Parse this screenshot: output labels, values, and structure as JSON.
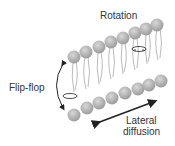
{
  "diagram": {
    "labels": {
      "rotation": "Rotation",
      "flipflop": "Flip-flop",
      "lateral_line1": "Lateral",
      "lateral_line2": "diffusion"
    },
    "colors": {
      "head": "#a9a9a9",
      "tail": "#9a9a9a",
      "arrow": "#222222",
      "text": "#333333"
    }
  }
}
